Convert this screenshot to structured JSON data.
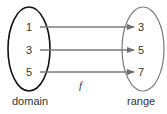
{
  "diagram": {
    "type": "function-mapping",
    "function_label": "f",
    "domain": {
      "label": "domain",
      "values": [
        "1",
        "3",
        "5"
      ],
      "color": "#111111"
    },
    "range": {
      "label": "range",
      "values": [
        "3",
        "5",
        "7"
      ],
      "color": "#777777"
    },
    "mappings": [
      {
        "from": "1",
        "to": "3"
      },
      {
        "from": "3",
        "to": "5"
      },
      {
        "from": "5",
        "to": "7"
      }
    ],
    "arrow_color": "#7a7a7a"
  }
}
